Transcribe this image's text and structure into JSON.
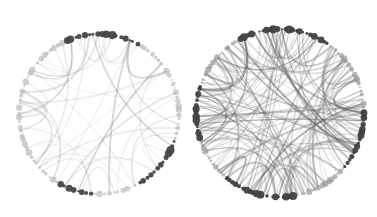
{
  "figure": {
    "graphs": [
      {
        "id": "left",
        "center": [
          99,
          114
        ],
        "radius": 80,
        "node_count": 110,
        "edge_count": 45,
        "edge_opacity": 0.18,
        "dark_clusters_deg": [
          [
            -115,
            -60
          ],
          [
            20,
            60
          ],
          [
            95,
            120
          ]
        ],
        "node_color_dark": "#444444",
        "node_color_light": "#bbbbbb"
      },
      {
        "id": "right",
        "center": [
          280,
          113
        ],
        "radius": 84,
        "node_count": 140,
        "edge_count": 140,
        "edge_opacity": 0.32,
        "dark_clusters_deg": [
          [
            -120,
            -55
          ],
          [
            0,
            40
          ],
          [
            80,
            130
          ],
          [
            160,
            200
          ]
        ],
        "node_color_dark": "#404040",
        "node_color_light": "#999999"
      }
    ]
  }
}
